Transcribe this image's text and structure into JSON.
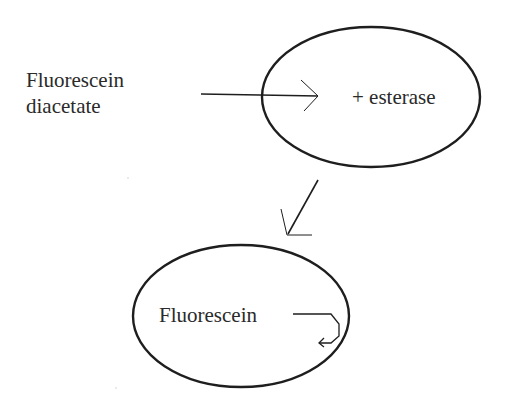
{
  "diagram": {
    "substrate": {
      "line1": "Fluorescein",
      "line2": "diacetate"
    },
    "cell_top": {
      "label": "+ esterase"
    },
    "cell_bottom": {
      "label": "Fluorescein"
    },
    "colors": {
      "stroke": "#1e1e1e",
      "text": "#2a2a2a",
      "background": "#ffffff"
    },
    "icons": {
      "input_arrow": "right-arrow-icon",
      "transition_arrow": "down-left-arrow-icon",
      "retention_arrow": "hook-arrow-icon"
    }
  }
}
